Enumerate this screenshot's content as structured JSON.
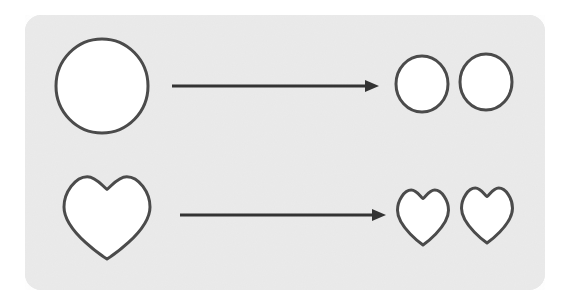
{
  "figure": {
    "title": "Shape halving diagram",
    "card": {
      "x": 25,
      "y": 15,
      "width": 520,
      "height": 275,
      "corner_radius": 16,
      "fill": "#eaeaea"
    },
    "stroke_color": "#4b4b4b",
    "shape_fill": "#ffffff",
    "stroke_width": 3,
    "arrow_color": "#333333",
    "page_background": "#ffffff"
  },
  "rows": [
    {
      "id": "circle-row",
      "name": "circle-row",
      "shape_kind": "circle",
      "source": {
        "name": "large-circle",
        "cx": 102,
        "cy": 86,
        "rx": 46,
        "ry": 47
      },
      "arrow": {
        "name": "transform-arrow-circles",
        "x1": 172,
        "x2": 379,
        "y": 86,
        "head_length": 14,
        "head_half_width": 6
      },
      "results": [
        {
          "name": "small-circle-left",
          "cx": 422,
          "cy": 84,
          "rx": 26,
          "ry": 28
        },
        {
          "name": "small-circle-right",
          "cx": 486,
          "cy": 82,
          "rx": 26,
          "ry": 28
        }
      ]
    },
    {
      "id": "heart-row",
      "name": "heart-row",
      "shape_kind": "heart",
      "source": {
        "name": "large-heart",
        "cx": 107,
        "cy": 217,
        "width": 86,
        "height": 84
      },
      "arrow": {
        "name": "transform-arrow-hearts",
        "x1": 180,
        "x2": 386,
        "y": 215,
        "head_length": 14,
        "head_half_width": 6
      },
      "results": [
        {
          "name": "small-heart-left",
          "cx": 423,
          "cy": 217,
          "width": 51,
          "height": 56
        },
        {
          "name": "small-heart-right",
          "cx": 487,
          "cy": 215,
          "width": 51,
          "height": 56
        }
      ]
    }
  ],
  "labels": {
    "none_visible": ""
  }
}
